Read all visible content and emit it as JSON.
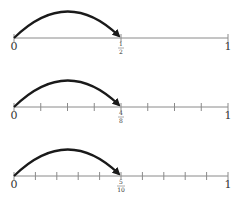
{
  "number_lines": [
    {
      "id": "halves",
      "divisions": 2,
      "jump_to": 1,
      "start_label": "0",
      "end_label": "1",
      "mark_numerator": "1",
      "mark_denominator": "2"
    },
    {
      "id": "eighths",
      "divisions": 8,
      "jump_to": 4,
      "start_label": "0",
      "end_label": "1",
      "mark_numerator": "4",
      "mark_denominator": "8"
    },
    {
      "id": "tenths",
      "divisions": 10,
      "jump_to": 5,
      "start_label": "0",
      "end_label": "1",
      "mark_numerator": "5",
      "mark_denominator": "10"
    }
  ],
  "colors": {
    "line": "#8a8a8a",
    "arrow": "#1a1a1a",
    "text": "#333333"
  }
}
